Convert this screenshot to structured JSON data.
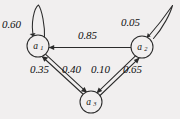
{
  "figure": {
    "type": "state-transition-diagram",
    "background_color": "#f1efef",
    "stroke_color": "#2b2b2b"
  },
  "nodes": [
    {
      "id": "a1",
      "label": "a",
      "subscript": "1",
      "cx": 38,
      "cy": 46,
      "r": 11
    },
    {
      "id": "a2",
      "label": "a",
      "subscript": "2",
      "cx": 142,
      "cy": 47,
      "r": 11
    },
    {
      "id": "a3",
      "label": "a",
      "subscript": "3",
      "cx": 91,
      "cy": 102,
      "r": 11
    }
  ],
  "edges": [
    {
      "id": "a1-a1",
      "from": "a1",
      "to": "a1",
      "weight": "0.60",
      "kind": "self-loop"
    },
    {
      "id": "a2-a2",
      "from": "a2",
      "to": "a2",
      "weight": "0.05",
      "kind": "self-loop"
    },
    {
      "id": "a2-a1",
      "from": "a2",
      "to": "a1",
      "weight": "0.85",
      "kind": "straight"
    },
    {
      "id": "a3-a1",
      "from": "a3",
      "to": "a1",
      "weight": "0.35",
      "kind": "straight"
    },
    {
      "id": "a1-a3",
      "from": "a1",
      "to": "a3",
      "weight": "0.40",
      "kind": "straight"
    },
    {
      "id": "a2-a3",
      "from": "a2",
      "to": "a3",
      "weight": "0.10",
      "kind": "straight"
    },
    {
      "id": "a3-a2",
      "from": "a3",
      "to": "a2",
      "weight": "0.65",
      "kind": "straight"
    }
  ],
  "labels": {
    "w_a1_self": "0.60",
    "w_a2_self": "0.05",
    "w_a2_a1": "0.85",
    "w_a3_a1": "0.35",
    "w_a1_a3": "0.40",
    "w_a2_a3": "0.10",
    "w_a3_a2": "0.65",
    "n1_base": "a",
    "n1_sub": "1",
    "n2_base": "a",
    "n2_sub": "2",
    "n3_base": "a",
    "n3_sub": "3"
  }
}
